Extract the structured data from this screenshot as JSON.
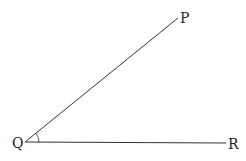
{
  "diagram": {
    "type": "angle",
    "vertex": {
      "label": "Q",
      "x": 25,
      "y": 142
    },
    "rays": [
      {
        "label": "P",
        "x": 178,
        "y": 18
      },
      {
        "label": "R",
        "x": 226,
        "y": 143
      }
    ],
    "angle_marked": "PQR",
    "line_color": "#333333"
  }
}
